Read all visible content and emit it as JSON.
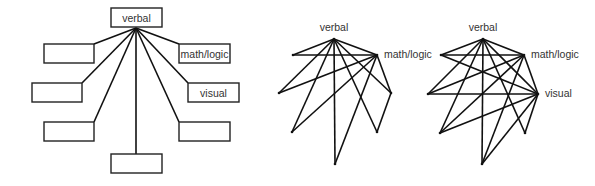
{
  "diagrams": [
    {
      "id": "hub-model",
      "nodes": [
        {
          "key": "verbal",
          "label": "verbal"
        },
        {
          "key": "n1",
          "label": ""
        },
        {
          "key": "math",
          "label": "math/logic"
        },
        {
          "key": "n2",
          "label": ""
        },
        {
          "key": "visual",
          "label": "visual"
        },
        {
          "key": "n3",
          "label": ""
        },
        {
          "key": "n4",
          "label": ""
        },
        {
          "key": "bottom",
          "label": ""
        }
      ],
      "edges": [
        [
          "verbal",
          "n1"
        ],
        [
          "verbal",
          "n2"
        ],
        [
          "verbal",
          "n3"
        ],
        [
          "verbal",
          "bottom"
        ],
        [
          "verbal",
          "n4"
        ],
        [
          "verbal",
          "visual"
        ],
        [
          "verbal",
          "math"
        ]
      ]
    },
    {
      "id": "network-two-hubs",
      "nodes": [
        {
          "key": "verbal",
          "label": "verbal"
        },
        {
          "key": "lt",
          "label": ""
        },
        {
          "key": "math",
          "label": "math/logic"
        },
        {
          "key": "lm",
          "label": ""
        },
        {
          "key": "rm",
          "label": ""
        },
        {
          "key": "ll",
          "label": ""
        },
        {
          "key": "lr",
          "label": ""
        },
        {
          "key": "bottom",
          "label": ""
        }
      ],
      "edges": [
        [
          "verbal",
          "lt"
        ],
        [
          "verbal",
          "lm"
        ],
        [
          "verbal",
          "ll"
        ],
        [
          "verbal",
          "bottom"
        ],
        [
          "verbal",
          "lr"
        ],
        [
          "verbal",
          "rm"
        ],
        [
          "verbal",
          "math"
        ],
        [
          "math",
          "lt"
        ],
        [
          "math",
          "lm"
        ],
        [
          "math",
          "ll"
        ],
        [
          "math",
          "bottom"
        ],
        [
          "math",
          "rm"
        ],
        [
          "rm",
          "lr"
        ]
      ]
    },
    {
      "id": "network-three-hubs",
      "nodes": [
        {
          "key": "verbal",
          "label": "verbal"
        },
        {
          "key": "lt",
          "label": ""
        },
        {
          "key": "math",
          "label": "math/logic"
        },
        {
          "key": "lm",
          "label": ""
        },
        {
          "key": "visual",
          "label": "visual"
        },
        {
          "key": "ll",
          "label": ""
        },
        {
          "key": "lr",
          "label": ""
        },
        {
          "key": "bottom",
          "label": ""
        }
      ],
      "edges": [
        [
          "verbal",
          "lt"
        ],
        [
          "verbal",
          "lm"
        ],
        [
          "verbal",
          "ll"
        ],
        [
          "verbal",
          "bottom"
        ],
        [
          "verbal",
          "lr"
        ],
        [
          "verbal",
          "visual"
        ],
        [
          "verbal",
          "math"
        ],
        [
          "math",
          "lt"
        ],
        [
          "math",
          "lm"
        ],
        [
          "math",
          "ll"
        ],
        [
          "math",
          "bottom"
        ],
        [
          "math",
          "visual"
        ],
        [
          "visual",
          "lt"
        ],
        [
          "visual",
          "lm"
        ],
        [
          "visual",
          "ll"
        ],
        [
          "visual",
          "bottom"
        ],
        [
          "visual",
          "lr"
        ]
      ]
    }
  ]
}
